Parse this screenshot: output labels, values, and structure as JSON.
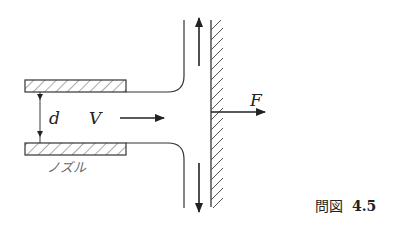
{
  "figure": {
    "caption_prefix": "問図",
    "caption_number": "4.5",
    "labels": {
      "diameter": "d",
      "velocity": "V",
      "force": "F",
      "nozzle": "ノズル"
    },
    "colors": {
      "line": "#333333",
      "hatch": "#555555",
      "background": "#ffffff"
    }
  }
}
